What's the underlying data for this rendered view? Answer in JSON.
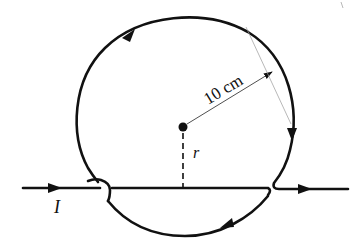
{
  "diagram": {
    "labels": {
      "current": "I",
      "radius_value": "10 cm",
      "distance": "r"
    },
    "elements": {
      "straight_wire": "horizontal wire carrying current I left to right",
      "circular_loop": "loop of radius 10 cm, current circulating clockwise",
      "center_point": "filled dot at loop center",
      "distance_marker": "dashed line r from center to straight wire",
      "radius_arrow": "thin arrow from center to loop edge labeled 10 cm"
    },
    "arrows": [
      {
        "location": "left wire",
        "direction": "right"
      },
      {
        "location": "upper-left arc",
        "direction": "up-right"
      },
      {
        "location": "right arc",
        "direction": "down"
      },
      {
        "location": "bottom arc",
        "direction": "left"
      },
      {
        "location": "right wire",
        "direction": "right"
      }
    ],
    "colors": {
      "stroke": "#111111",
      "background": "#ffffff",
      "guide_line": "#9a9a9a"
    }
  }
}
